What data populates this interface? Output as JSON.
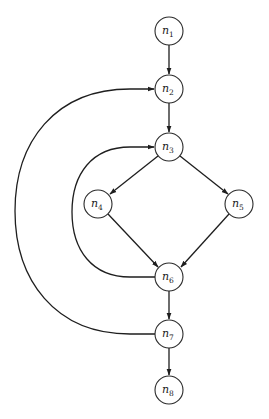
{
  "diagram": {
    "type": "control-flow-graph",
    "stroke_color": "#1e1e1e",
    "background": "#ffffff",
    "nodes": [
      {
        "id": "n1",
        "base": "n",
        "sub": "1",
        "x": 169,
        "y": 31
      },
      {
        "id": "n2",
        "base": "n",
        "sub": "2",
        "x": 169,
        "y": 89
      },
      {
        "id": "n3",
        "base": "n",
        "sub": "3",
        "x": 169,
        "y": 147
      },
      {
        "id": "n4",
        "base": "n",
        "sub": "4",
        "x": 98,
        "y": 204
      },
      {
        "id": "n5",
        "base": "n",
        "sub": "5",
        "x": 239,
        "y": 204
      },
      {
        "id": "n6",
        "base": "n",
        "sub": "6",
        "x": 169,
        "y": 277
      },
      {
        "id": "n7",
        "base": "n",
        "sub": "7",
        "x": 169,
        "y": 334
      },
      {
        "id": "n8",
        "base": "n",
        "sub": "8",
        "x": 169,
        "y": 390
      }
    ],
    "edges": [
      {
        "from": "n1",
        "to": "n2"
      },
      {
        "from": "n2",
        "to": "n3"
      },
      {
        "from": "n3",
        "to": "n4"
      },
      {
        "from": "n3",
        "to": "n5"
      },
      {
        "from": "n4",
        "to": "n6"
      },
      {
        "from": "n5",
        "to": "n6"
      },
      {
        "from": "n6",
        "to": "n3",
        "kind": "back-edge"
      },
      {
        "from": "n6",
        "to": "n7"
      },
      {
        "from": "n7",
        "to": "n2",
        "kind": "back-edge"
      },
      {
        "from": "n7",
        "to": "n8"
      }
    ]
  }
}
